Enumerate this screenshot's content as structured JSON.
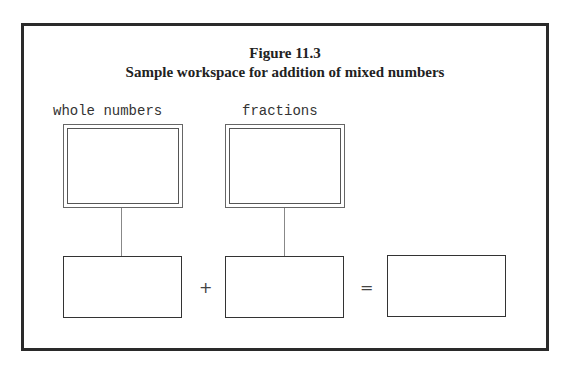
{
  "figure": {
    "title": "Figure 11.3",
    "subtitle": "Sample workspace for addition of mixed numbers"
  },
  "labels": {
    "whole": "whole numbers",
    "fractions": "fractions"
  },
  "operators": {
    "plus": "+",
    "equals": "="
  }
}
